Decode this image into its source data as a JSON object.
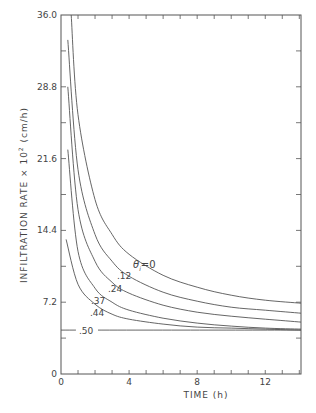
{
  "chart_data": {
    "type": "line",
    "title": "",
    "xlabel": "TIME (h)",
    "ylabel": "INFILTRATION RATE × 10² (cm/h)",
    "xlim": [
      0,
      14.1
    ],
    "ylim": [
      0,
      36.0
    ],
    "x_ticks": [
      0,
      4,
      8,
      12
    ],
    "x_tick_labels": [
      "0",
      "4",
      "8",
      "12"
    ],
    "y_ticks": [
      0,
      7.2,
      14.4,
      21.6,
      28.8,
      36.0
    ],
    "y_tick_labels": [
      "0",
      "7.2",
      "14.4",
      "21.6",
      "28.8",
      "36.0"
    ],
    "grid": false,
    "legend": "inline curve labels",
    "series": [
      {
        "name": "θi=0",
        "label": "θ₁=0",
        "x": [
          0.6,
          1,
          2,
          3,
          4,
          6,
          8,
          10,
          12,
          14.1
        ],
        "values": [
          36.0,
          26.0,
          17.5,
          14.0,
          12.0,
          9.9,
          8.7,
          7.9,
          7.4,
          7.1
        ]
      },
      {
        "name": "θi=.12",
        "label": ".12",
        "x": [
          0.4,
          1,
          2,
          3,
          4,
          6,
          8,
          10,
          12,
          14.1
        ],
        "values": [
          33.5,
          20.5,
          14.0,
          11.3,
          9.8,
          8.2,
          7.3,
          6.7,
          6.4,
          6.1
        ]
      },
      {
        "name": "θi=.24",
        "label": ".24",
        "x": [
          0.4,
          1,
          2,
          3,
          4,
          6,
          8,
          10,
          12,
          14.1
        ],
        "values": [
          28.8,
          16.5,
          11.3,
          9.2,
          8.1,
          6.9,
          6.2,
          5.8,
          5.5,
          5.2
        ]
      },
      {
        "name": "θi=.37",
        "label": ".37",
        "x": [
          0.4,
          1,
          2,
          3,
          4,
          6,
          8,
          10,
          12,
          14.1
        ],
        "values": [
          22.5,
          12.3,
          8.6,
          7.2,
          6.4,
          5.6,
          5.1,
          4.8,
          4.6,
          4.5
        ]
      },
      {
        "name": "θi=.44",
        "label": ".44",
        "x": [
          0.3,
          1,
          2,
          3,
          4,
          6,
          8,
          10,
          12,
          14.1
        ],
        "values": [
          13.5,
          9.0,
          7.0,
          6.0,
          5.5,
          5.0,
          4.7,
          4.6,
          4.5,
          4.4
        ]
      },
      {
        "name": "θi=.50",
        "label": ".50",
        "x": [
          0,
          14.1
        ],
        "values": [
          4.4,
          4.4
        ]
      }
    ]
  },
  "labels": {
    "x_axis": "TIME (h)",
    "y_axis": "INFILTRATION RATE × 10",
    "y_axis_sup": "2",
    "y_axis_units": "(cm/h)",
    "theta_label": "θ",
    "theta_sub": "i",
    "theta_eq": "=0",
    "curve_labels": [
      ".12",
      ".24",
      ".37",
      ".44",
      ".50"
    ]
  },
  "colors": {
    "line": "#555555",
    "axis": "#555555",
    "text": "#444444",
    "background": "#ffffff"
  }
}
